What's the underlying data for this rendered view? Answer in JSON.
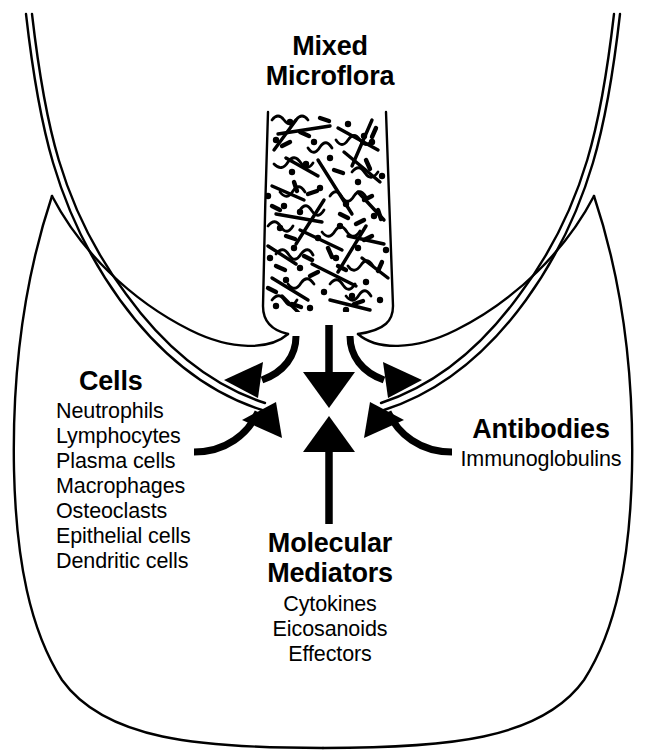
{
  "figure": {
    "title": "Mixed Microflora",
    "background_color": "#ffffff",
    "ink_color": "#000000"
  },
  "labels": {
    "microflora": {
      "heading_lines": [
        "Mixed",
        "Microflora"
      ],
      "style": "bold"
    },
    "cells": {
      "heading": "Cells",
      "items": [
        "Neutrophils",
        "Lymphocytes",
        "Plasma cells",
        "Macrophages",
        "Osteoclasts",
        "Epithelial cells",
        "Dendritic cells"
      ]
    },
    "antibodies": {
      "heading": "Antibodies",
      "items": [
        "Immunoglobulins"
      ]
    },
    "mediators": {
      "heading_lines": [
        "Molecular",
        "Mediators"
      ],
      "items": [
        "Cytokines",
        "Eicosanoids",
        "Effectors"
      ]
    }
  },
  "anatomy": {
    "tooth_left": "tooth-surface-left",
    "tooth_right": "tooth-surface-right",
    "gingiva": "gingival-tissue-outline",
    "sulcus": "gingival-sulcus",
    "plaque": "subgingival-plaque-biofilm"
  },
  "microflora_content": {
    "morphotypes": [
      "rods",
      "cocci",
      "spirochetes",
      "filaments"
    ],
    "description": "dense mixed bacterial biofilm in the gingival sulcus"
  },
  "arrows": [
    {
      "name": "plaque-to-tissue-down",
      "direction": "down",
      "position": "center"
    },
    {
      "name": "tissue-to-plaque-up",
      "direction": "up",
      "position": "center"
    },
    {
      "name": "cells-outflow-left",
      "direction": "out-left",
      "position": "left"
    },
    {
      "name": "cells-inflow-left",
      "direction": "in-right",
      "position": "left"
    },
    {
      "name": "antibodies-outflow-right",
      "direction": "out-right",
      "position": "right"
    },
    {
      "name": "antibodies-inflow-right",
      "direction": "in-left",
      "position": "right"
    }
  ]
}
